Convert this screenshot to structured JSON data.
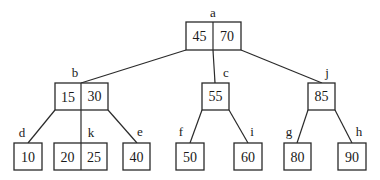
{
  "diagram": {
    "type": "b-tree",
    "nodes": {
      "a": {
        "label": "a",
        "keys": [
          "45",
          "70"
        ]
      },
      "b": {
        "label": "b",
        "keys": [
          "15",
          "30"
        ]
      },
      "c": {
        "label": "c",
        "keys": [
          "55"
        ]
      },
      "j": {
        "label": "j",
        "keys": [
          "85"
        ]
      },
      "d": {
        "label": "d",
        "keys": [
          "10"
        ]
      },
      "k": {
        "label": "k",
        "keys": [
          "20",
          "25"
        ]
      },
      "e": {
        "label": "e",
        "keys": [
          "40"
        ]
      },
      "f": {
        "label": "f",
        "keys": [
          "50"
        ]
      },
      "i": {
        "label": "i",
        "keys": [
          "60"
        ]
      },
      "g": {
        "label": "g",
        "keys": [
          "80"
        ]
      },
      "h": {
        "label": "h",
        "keys": [
          "90"
        ]
      }
    },
    "edges": [
      [
        "a",
        "b"
      ],
      [
        "a",
        "c"
      ],
      [
        "a",
        "j"
      ],
      [
        "b",
        "d"
      ],
      [
        "b",
        "k"
      ],
      [
        "b",
        "e"
      ],
      [
        "c",
        "f"
      ],
      [
        "c",
        "i"
      ],
      [
        "j",
        "g"
      ],
      [
        "j",
        "h"
      ]
    ]
  }
}
